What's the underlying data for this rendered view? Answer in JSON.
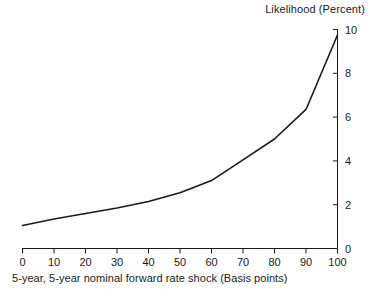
{
  "chart_data": {
    "type": "line",
    "title": "Likelihood (Percent)",
    "xlabel": "5-year, 5-year nominal forward rate shock  (Basis points)",
    "ylabel": "Likelihood (Percent)",
    "xlim": [
      0,
      100
    ],
    "ylim": [
      0,
      10
    ],
    "xticks": [
      0,
      10,
      20,
      30,
      40,
      50,
      60,
      70,
      80,
      90,
      100
    ],
    "xtick_labels": [
      "0",
      "10",
      "20",
      "30",
      "40",
      "50",
      "60",
      "70",
      "80",
      "90",
      "100"
    ],
    "yticks": [
      0,
      2,
      4,
      6,
      8,
      10
    ],
    "ytick_labels": [
      "0",
      "2",
      "4",
      "6",
      "8",
      "10"
    ],
    "y_axis_position": "right",
    "grid": false,
    "legend": null,
    "line_color": "#1a1a1a",
    "line_width": 1.6,
    "x": [
      0,
      10,
      20,
      30,
      40,
      50,
      60,
      70,
      80,
      90,
      100
    ],
    "values": [
      1.05,
      1.35,
      1.6,
      1.85,
      2.15,
      2.55,
      3.1,
      4.05,
      5.0,
      6.35,
      9.75
    ],
    "series": [
      {
        "name": "Likelihood",
        "x": [
          0,
          10,
          20,
          30,
          40,
          50,
          60,
          70,
          80,
          90,
          100
        ],
        "values": [
          1.05,
          1.35,
          1.6,
          1.85,
          2.15,
          2.55,
          3.1,
          4.05,
          5.0,
          6.35,
          9.75
        ]
      }
    ]
  },
  "axis": {
    "title_text": "Likelihood (Percent)",
    "xlabel_text": "5-year, 5-year nominal forward rate shock  (Basis points)",
    "x0": "0",
    "x10": "10",
    "x20": "20",
    "x30": "30",
    "x40": "40",
    "x50": "50",
    "x60": "60",
    "x70": "70",
    "x80": "80",
    "x90": "90",
    "x100": "100",
    "y0": "0",
    "y2": "2",
    "y4": "4",
    "y6": "6",
    "y8": "8",
    "y10": "10"
  }
}
